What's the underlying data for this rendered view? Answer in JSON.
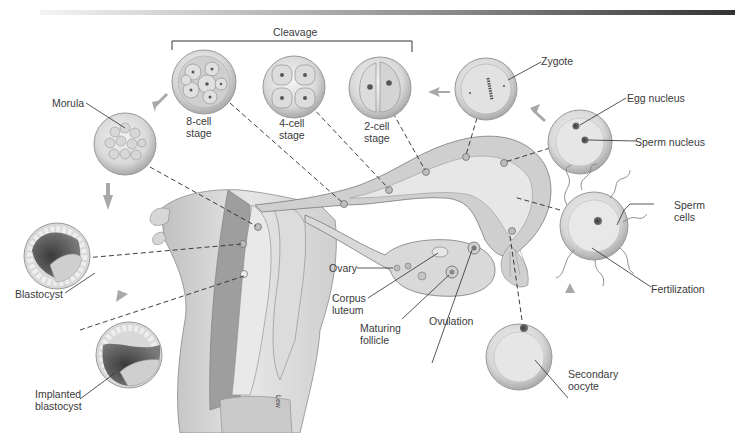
{
  "labels": {
    "cleavage": "Cleavage",
    "zygote": "Zygote",
    "egg_nucleus": "Egg nucleus",
    "sperm_nucleus": "Sperm nucleus",
    "sperm_cells_1": "Sperm",
    "sperm_cells_2": "cells",
    "fertilization": "Fertilization",
    "secondary_oocyte_1": "Secondary",
    "secondary_oocyte_2": "oocyte",
    "ovulation": "Ovulation",
    "maturing_follicle_1": "Maturing",
    "maturing_follicle_2": "follicle",
    "corpus_luteum_1": "Corpus",
    "corpus_luteum_2": "luteum",
    "ovary": "Ovary",
    "morula": "Morula",
    "blastocyst": "Blastocyst",
    "implanted_blastocyst_1": "Implanted",
    "implanted_blastocyst_2": "blastocyst",
    "stage_8_1": "8-cell",
    "stage_8_2": "stage",
    "stage_4_1": "4-cell",
    "stage_4_2": "stage",
    "stage_2_1": "2-cell",
    "stage_2_2": "stage",
    "artist_signature": "Lew"
  },
  "colors": {
    "line": "#2b2b2b",
    "arrow": "#a8a8a8",
    "cell_fill": "#e2e2e2",
    "cell_rim": "#bdbdbd",
    "tissue": "#d4d4d4",
    "dark_tissue": "#6a6a6a"
  }
}
